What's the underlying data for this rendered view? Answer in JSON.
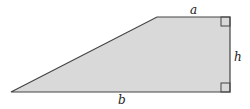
{
  "diagram": {
    "type": "right-trapezoid",
    "fill_color": "#d9d9d9",
    "stroke_color": "#444444",
    "vertices": {
      "bottom_left": [
        11,
        92
      ],
      "top_left": [
        157,
        17
      ],
      "top_right": [
        230,
        17
      ],
      "bottom_right": [
        230,
        92
      ]
    },
    "labels": {
      "top": "a",
      "right": "h",
      "bottom": "b"
    },
    "right_angle_marks": [
      "top-right",
      "bottom-right"
    ]
  }
}
